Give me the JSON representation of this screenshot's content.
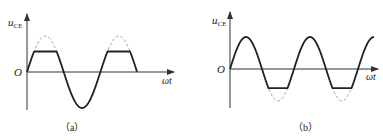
{
  "panels": [
    {
      "id": "a",
      "caption": "（a）",
      "y_label": "u",
      "y_label_sub": "CE",
      "origin_label": "O",
      "x_label": "ωt",
      "description": "Sine wave clipped at positive peaks (top clipping); dashed lines show the unclipped waveform"
    },
    {
      "id": "b",
      "caption": "（b）",
      "y_label": "u",
      "y_label_sub": "CE",
      "origin_label": "O",
      "x_label": "ωt",
      "description": "Sine wave clipped at negative peaks (bottom clipping); dashed lines show the unclipped waveform"
    }
  ],
  "chart_data": [
    {
      "type": "line",
      "title": "(a)",
      "xlabel": "ωt",
      "ylabel": "u_CE",
      "series": [
        {
          "name": "ideal sine (dashed)",
          "shape": "sine",
          "periods": 1.5,
          "amplitude": 1.0
        },
        {
          "name": "output (solid)",
          "shape": "sine clipped at positive peaks",
          "clip_level": 0.57,
          "periods": 1.5
        }
      ]
    },
    {
      "type": "line",
      "title": "(b)",
      "xlabel": "ωt",
      "ylabel": "u_CE",
      "series": [
        {
          "name": "ideal sine (dashed)",
          "shape": "sine",
          "periods": 2.25,
          "amplitude": 1.0
        },
        {
          "name": "output (solid)",
          "shape": "sine clipped at negative peaks",
          "clip_level": -0.6,
          "periods": 2.25
        }
      ]
    }
  ]
}
